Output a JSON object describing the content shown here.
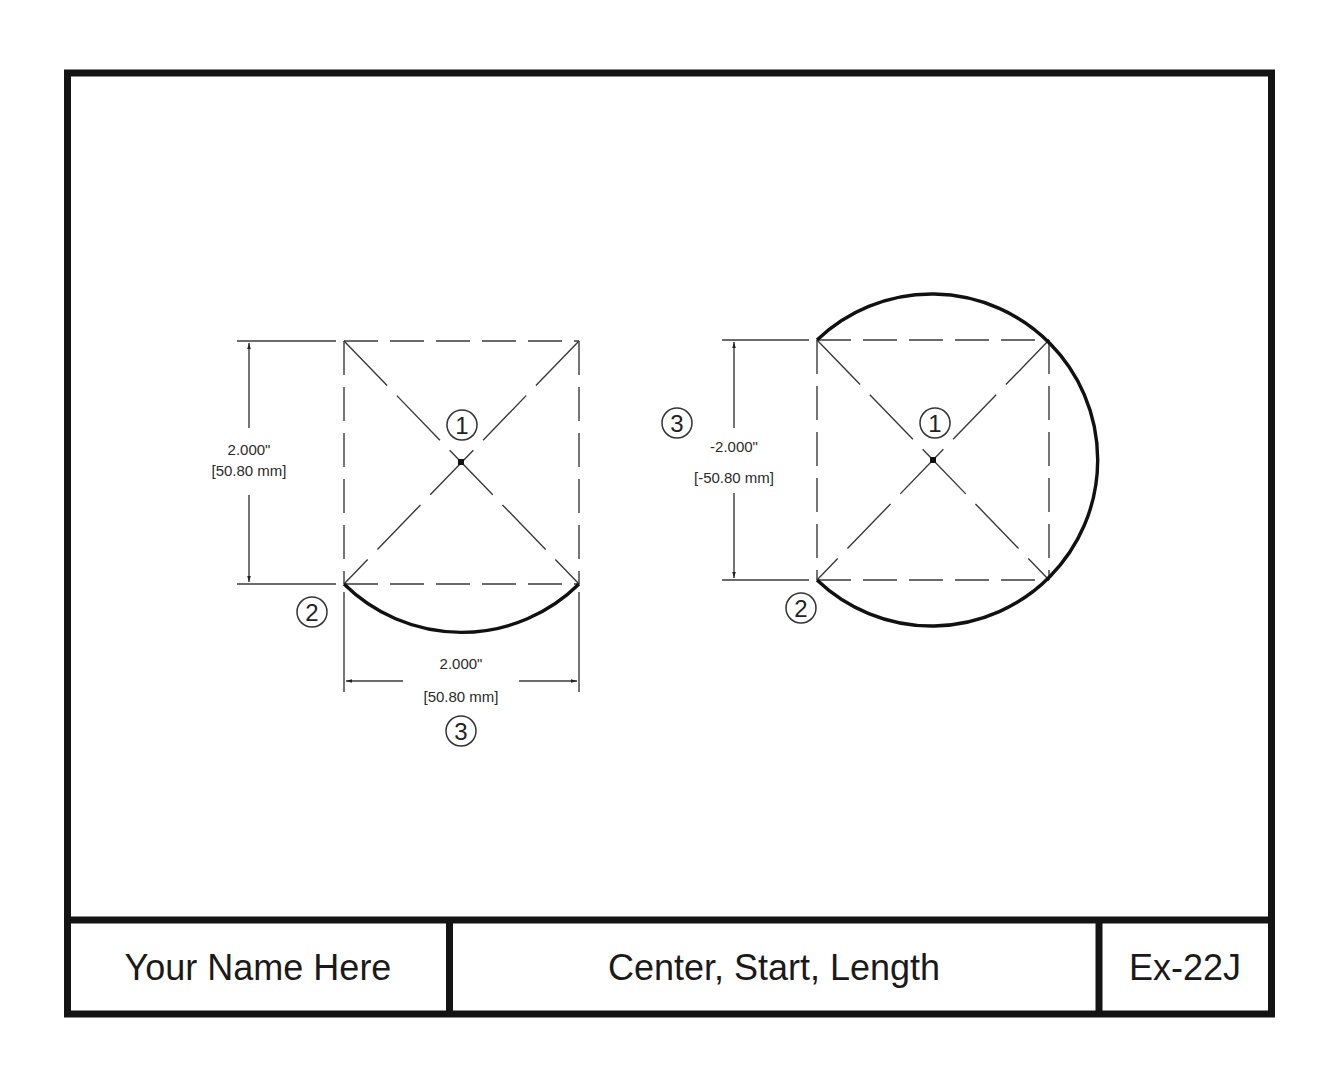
{
  "title_block": {
    "name": "Your Name Here",
    "title": "Center, Start, Length",
    "exercise_id": "Ex-22J"
  },
  "figures": [
    {
      "id": "left",
      "vertical_dimension": {
        "inch": "2.000\"",
        "mm": "[50.80 mm]"
      },
      "horizontal_dimension": {
        "inch": "2.000\"",
        "mm": "[50.80 mm]"
      },
      "callouts": {
        "center": "1",
        "start": "2",
        "length": "3"
      }
    },
    {
      "id": "right",
      "vertical_dimension": {
        "inch": "-2.000\"",
        "mm": "[-50.80 mm]"
      },
      "callouts": {
        "center": "1",
        "start": "2",
        "length": "3"
      }
    }
  ],
  "colors": {
    "line": "#141414",
    "construction": "#3a3a3a",
    "background": "#ffffff"
  }
}
